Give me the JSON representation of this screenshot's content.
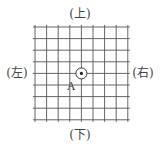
{
  "diagram": {
    "type": "grid-board",
    "grid": {
      "columns": 9,
      "rows": 9,
      "x_start": 35,
      "y_start": 27,
      "spacing": 11.6,
      "overhang": 2,
      "line_color": "#555555"
    },
    "labels": {
      "top": "(上)",
      "bottom": "(下)",
      "left": "(左)",
      "right": "(右)"
    },
    "marker": {
      "label": "A",
      "col": 4,
      "row": 4,
      "circle_radius": 5.5,
      "dot_radius": 1.6,
      "color": "#222222"
    }
  }
}
